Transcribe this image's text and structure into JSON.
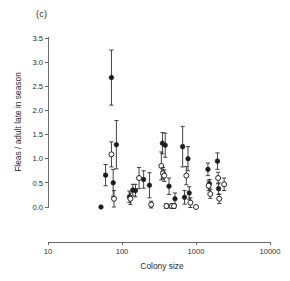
{
  "figure": {
    "panel_label": "(c)",
    "background": "#ffffff",
    "foreground": "#2b2b2b"
  },
  "chart_data": {
    "type": "scatter",
    "title": "(c)",
    "xlabel": "Colony size",
    "ylabel": "Fleas / adult late in season",
    "xscale": "log",
    "yscale": "linear",
    "xlim": [
      10,
      10000
    ],
    "ylim": [
      0.0,
      3.5
    ],
    "xticks": [
      10,
      100,
      1000,
      10000
    ],
    "xtick_labels": [
      "10",
      "100",
      "1000",
      "10000"
    ],
    "yticks": [
      0.0,
      0.5,
      1.0,
      1.5,
      2.0,
      2.5,
      3.0,
      3.5
    ],
    "ytick_labels": [
      "0.0",
      "0.5",
      "1.0",
      "1.5",
      "2.0",
      "2.5",
      "3.0",
      "3.5"
    ],
    "grid": false,
    "legend": "none",
    "error_bars": "vertical, symmetric, with caps",
    "marker_colors": {
      "filled": "#1c1c1c",
      "open": "#ffffff",
      "edge": "#1c1c1c"
    },
    "series": [
      {
        "name": "filled-circles",
        "marker": "filled circle",
        "points": [
          {
            "x": 52,
            "y": 0.0,
            "yerr": 0.0
          },
          {
            "x": 60,
            "y": 0.66,
            "yerr": 0.22
          },
          {
            "x": 72,
            "y": 2.68,
            "yerr": 0.57
          },
          {
            "x": 76,
            "y": 0.5,
            "yerr": 0.28
          },
          {
            "x": 84,
            "y": 1.29,
            "yerr": 0.5
          },
          {
            "x": 126,
            "y": 0.21,
            "yerr": 0.12
          },
          {
            "x": 140,
            "y": 0.35,
            "yerr": 0.12
          },
          {
            "x": 152,
            "y": 0.34,
            "yerr": 0.13
          },
          {
            "x": 196,
            "y": 0.57,
            "yerr": 0.18
          },
          {
            "x": 235,
            "y": 0.45,
            "yerr": 0.26
          },
          {
            "x": 352,
            "y": 1.32,
            "yerr": 0.22
          },
          {
            "x": 384,
            "y": 1.28,
            "yerr": 0.25
          },
          {
            "x": 432,
            "y": 0.43,
            "yerr": 0.17
          },
          {
            "x": 520,
            "y": 0.17,
            "yerr": 0.12
          },
          {
            "x": 660,
            "y": 1.25,
            "yerr": 0.42
          },
          {
            "x": 700,
            "y": 0.2,
            "yerr": 0.14
          },
          {
            "x": 780,
            "y": 1.0,
            "yerr": 0.25
          },
          {
            "x": 810,
            "y": 0.29,
            "yerr": 0.13
          },
          {
            "x": 1450,
            "y": 0.78,
            "yerr": 0.13
          },
          {
            "x": 1520,
            "y": 0.48,
            "yerr": 0.09
          },
          {
            "x": 1950,
            "y": 0.95,
            "yerr": 0.17
          },
          {
            "x": 2020,
            "y": 0.38,
            "yerr": 0.12
          }
        ]
      },
      {
        "name": "open-circles",
        "marker": "open circle",
        "points": [
          {
            "x": 72,
            "y": 1.09,
            "yerr": 0.26
          },
          {
            "x": 78,
            "y": 0.17,
            "yerr": 0.17
          },
          {
            "x": 130,
            "y": 0.17,
            "yerr": 0.12
          },
          {
            "x": 170,
            "y": 0.6,
            "yerr": 0.22
          },
          {
            "x": 248,
            "y": 0.05,
            "yerr": 0.07
          },
          {
            "x": 340,
            "y": 0.85,
            "yerr": 0.29
          },
          {
            "x": 358,
            "y": 0.7,
            "yerr": 0.12
          },
          {
            "x": 372,
            "y": 0.65,
            "yerr": 0.12
          },
          {
            "x": 398,
            "y": 0.02,
            "yerr": 0.05
          },
          {
            "x": 470,
            "y": 0.02,
            "yerr": 0.05
          },
          {
            "x": 505,
            "y": 0.02,
            "yerr": 0.05
          },
          {
            "x": 740,
            "y": 0.65,
            "yerr": 0.19
          },
          {
            "x": 840,
            "y": 0.09,
            "yerr": 0.1
          },
          {
            "x": 1000,
            "y": 0.0,
            "yerr": 0.0
          },
          {
            "x": 1480,
            "y": 0.44,
            "yerr": 0.1
          },
          {
            "x": 1560,
            "y": 0.27,
            "yerr": 0.09
          },
          {
            "x": 1990,
            "y": 0.6,
            "yerr": 0.12
          },
          {
            "x": 2060,
            "y": 0.17,
            "yerr": 0.1
          },
          {
            "x": 2400,
            "y": 0.47,
            "yerr": 0.13
          }
        ]
      }
    ]
  },
  "axes": {
    "x_title": "Colony size",
    "y_title": "Fleas / adult late in season"
  }
}
